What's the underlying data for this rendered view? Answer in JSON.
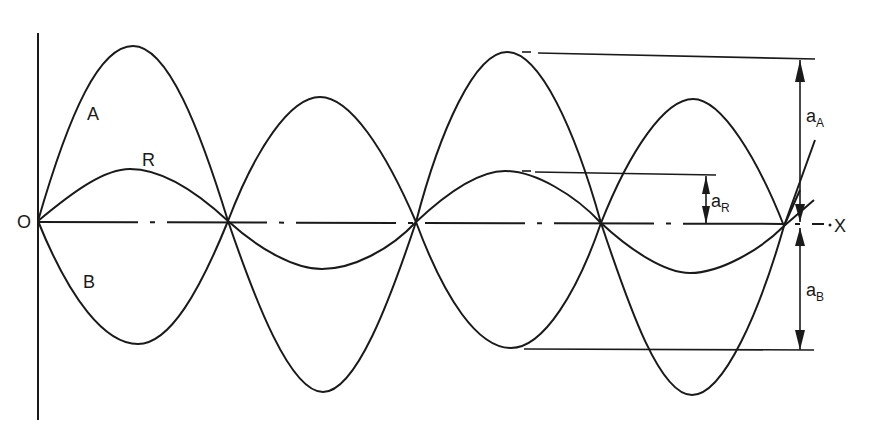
{
  "figure": {
    "type": "wave superposition diagram",
    "origin_label": "O",
    "x_axis_label": "X",
    "curves": [
      {
        "id": "A",
        "label": "A",
        "description": "wave A"
      },
      {
        "id": "B",
        "label": "B",
        "description": "wave B"
      },
      {
        "id": "R",
        "label": "R",
        "description": "resultant wave R"
      }
    ],
    "dimensions": [
      {
        "id": "aA",
        "label": "a",
        "subscript": "A"
      },
      {
        "id": "aR",
        "label": "a",
        "subscript": "R"
      },
      {
        "id": "aB",
        "label": "a",
        "subscript": "B"
      }
    ],
    "nodes_x": [
      38,
      228,
      416,
      601,
      784
    ],
    "lobes": [
      {
        "a_peak_y": 46,
        "r_peak_y": 169,
        "b_trough_y": 344
      },
      {
        "a_peak_y": 97,
        "r_trough_y": 269,
        "b_trough_y": 392
      },
      {
        "a_peak_y": 52,
        "r_peak_y": 171,
        "b_trough_y": 348
      },
      {
        "a_peak_y": 99,
        "r_trough_y": 273,
        "b_trough_y": 395
      }
    ]
  },
  "colors": {
    "ink": "#1a1a1a",
    "background": "#ffffff"
  }
}
